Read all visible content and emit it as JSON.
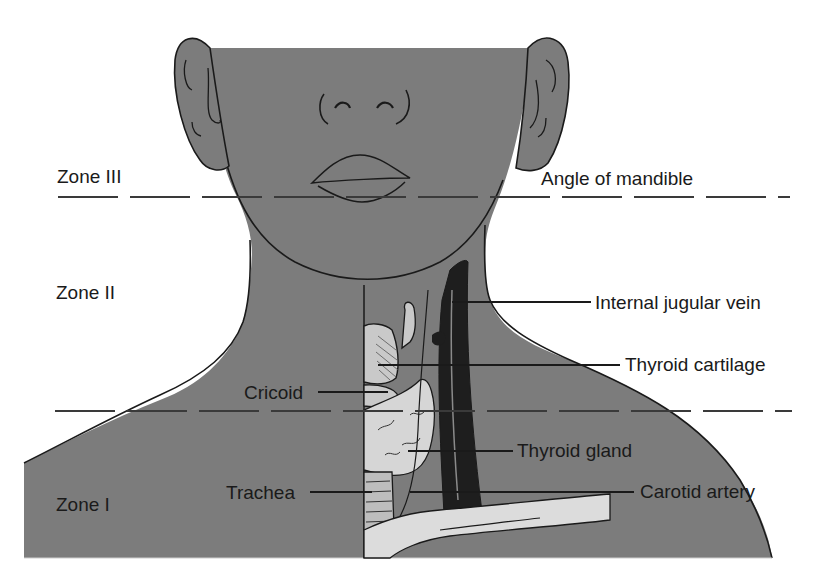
{
  "figure": {
    "colors": {
      "skin": "#7c7c7c",
      "outline": "#1a1a1a",
      "cartilage": "#c9c9c9",
      "gland": "#d6d6d6",
      "vein": "#1e1e1e",
      "clavicle": "#dcdcdc",
      "background": "#ffffff"
    }
  },
  "zones": [
    {
      "id": "zone3",
      "label": "Zone III"
    },
    {
      "id": "zone2",
      "label": "Zone II"
    },
    {
      "id": "zone1",
      "label": "Zone I"
    }
  ],
  "boundaries": [
    {
      "id": "upper",
      "label": "Angle of mandible"
    }
  ],
  "structures": [
    {
      "id": "ijv",
      "label": "Internal jugular vein"
    },
    {
      "id": "thyroid_cartilage",
      "label": "Thyroid cartilage"
    },
    {
      "id": "cricoid",
      "label": "Cricoid"
    },
    {
      "id": "thyroid_gland",
      "label": "Thyroid gland"
    },
    {
      "id": "trachea",
      "label": "Trachea"
    },
    {
      "id": "carotid",
      "label": "Carotid artery"
    }
  ]
}
